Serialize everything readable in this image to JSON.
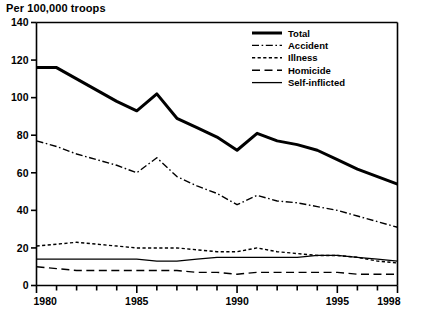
{
  "title": "Per 100,000 troops",
  "chart_data": {
    "type": "line",
    "title": "Per 100,000 troops",
    "xlabel": "",
    "ylabel": "Per 100,000 troops",
    "xlim": [
      1980,
      1998
    ],
    "ylim": [
      0,
      140
    ],
    "yticks": [
      0,
      20,
      40,
      60,
      80,
      100,
      120,
      140
    ],
    "ytick_labels": [
      "0",
      "20",
      "40",
      "60",
      "80",
      "100",
      "120",
      "140"
    ],
    "xticks": [
      1980,
      1981,
      1982,
      1983,
      1984,
      1985,
      1986,
      1987,
      1988,
      1989,
      1990,
      1991,
      1992,
      1993,
      1994,
      1995,
      1996,
      1997,
      1998
    ],
    "xtick_labels_shown": [
      "1980",
      "1985",
      "1990",
      "1995",
      "1998"
    ],
    "xtick_labels_shown_at": [
      1980,
      1985,
      1990,
      1995,
      1998
    ],
    "grid": false,
    "legend_position": "top-right",
    "x": [
      1980,
      1981,
      1982,
      1983,
      1984,
      1985,
      1986,
      1987,
      1988,
      1989,
      1990,
      1991,
      1992,
      1993,
      1994,
      1995,
      1996,
      1997,
      1998
    ],
    "series": [
      {
        "name": "Total",
        "style": "solid-thick",
        "values": [
          116,
          116,
          110,
          104,
          98,
          93,
          102,
          89,
          84,
          79,
          72,
          81,
          77,
          75,
          72,
          67,
          62,
          58,
          54
        ]
      },
      {
        "name": "Accident",
        "style": "dash-dot",
        "values": [
          77,
          74,
          70,
          67,
          64,
          60,
          68,
          58,
          53,
          49,
          43,
          48,
          45,
          44,
          42,
          40,
          37,
          34,
          31
        ]
      },
      {
        "name": "Illness",
        "style": "dotted",
        "values": [
          21,
          22,
          23,
          22,
          21,
          20,
          20,
          20,
          19,
          18,
          18,
          20,
          18,
          17,
          16,
          16,
          15,
          13,
          12
        ]
      },
      {
        "name": "Homicide",
        "style": "long-dash",
        "values": [
          10,
          9,
          8,
          8,
          8,
          8,
          8,
          8,
          7,
          7,
          6,
          7,
          7,
          7,
          7,
          7,
          6,
          6,
          6
        ]
      },
      {
        "name": "Self-inflicted",
        "style": "solid-thin",
        "values": [
          14,
          14,
          14,
          14,
          14,
          14,
          13,
          13,
          14,
          15,
          15,
          15,
          15,
          15,
          16,
          16,
          15,
          14,
          13
        ]
      }
    ]
  },
  "legend": {
    "items": [
      {
        "label": "Total",
        "style": "solid-thick"
      },
      {
        "label": "Accident",
        "style": "dash-dot"
      },
      {
        "label": "Illness",
        "style": "dotted"
      },
      {
        "label": "Homicide",
        "style": "long-dash"
      },
      {
        "label": "Self-inflicted",
        "style": "solid-thin"
      }
    ]
  },
  "colors": {
    "ink": "#000000",
    "background": "#ffffff"
  }
}
